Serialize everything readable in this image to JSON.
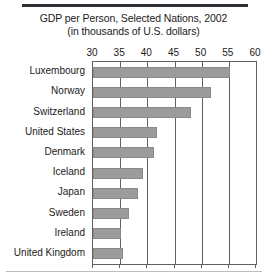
{
  "chart_data": {
    "type": "bar",
    "orientation": "horizontal",
    "title": "GDP per Person, Selected Nations, 2002",
    "subtitle": "(in thousands of U.S. dollars)",
    "xlabel": "",
    "ylabel": "",
    "xlim": [
      30,
      60
    ],
    "xticks": [
      30,
      35,
      40,
      45,
      50,
      55,
      60
    ],
    "xticklabels": [
      "30",
      "35",
      "40",
      "45",
      "50",
      "55",
      "60"
    ],
    "grid": "vertical",
    "legend": "none",
    "bar_color": "#9b9b9b",
    "categories": [
      "Luxembourg",
      "Norway",
      "Switzerland",
      "United States",
      "Denmark",
      "Iceland",
      "Japan",
      "Sweden",
      "Ireland",
      "United Kingdom"
    ],
    "values": [
      55.3,
      51.7,
      48.0,
      41.8,
      41.2,
      39.2,
      38.3,
      36.6,
      35.2,
      35.5
    ],
    "series": [
      {
        "name": "GDP per Person 2002",
        "values": [
          55.3,
          51.7,
          48.0,
          41.8,
          41.2,
          39.2,
          38.3,
          36.6,
          35.2,
          35.5
        ]
      }
    ]
  },
  "figure": {
    "rule_top_color": "#2b2f33",
    "rule_bottom_color": "#b9bdc0",
    "axis_color": "#5d6165",
    "background": "#ffffff"
  }
}
